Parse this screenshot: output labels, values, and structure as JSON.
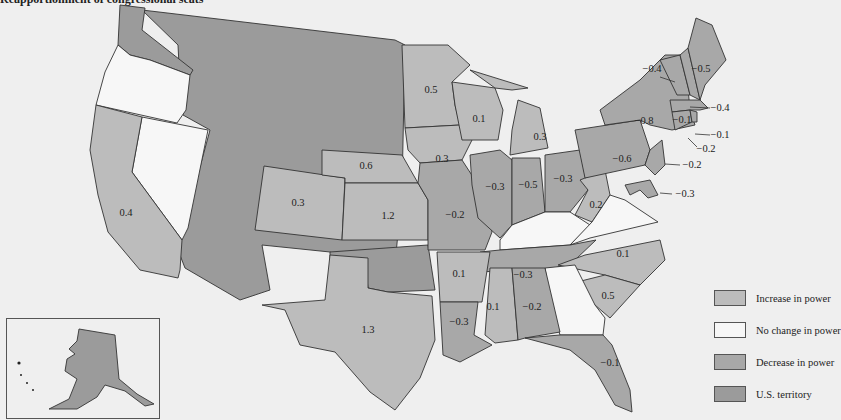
{
  "title": "Reapportionment of congressional seats",
  "colors": {
    "increase": "#bcbcbc",
    "no_change": "#f7f7f7",
    "decrease": "#a8a8a8",
    "territory": "#9b9b9b",
    "background": "#efefef"
  },
  "legend": {
    "items": [
      {
        "key": "increase",
        "label": "Increase in power"
      },
      {
        "key": "no_change",
        "label": "No change in power"
      },
      {
        "key": "decrease",
        "label": "Decrease in power"
      },
      {
        "key": "territory",
        "label": "U.S. territory"
      }
    ]
  },
  "states": {
    "WA": {
      "category": "territory",
      "value": ""
    },
    "OR": {
      "category": "no_change",
      "value": ""
    },
    "NV": {
      "category": "no_change",
      "value": ""
    },
    "CA": {
      "category": "increase",
      "value": "0.4"
    },
    "CO": {
      "category": "increase",
      "value": "0.3"
    },
    "NE": {
      "category": "increase",
      "value": "0.6"
    },
    "KS": {
      "category": "increase",
      "value": "1.2"
    },
    "MN": {
      "category": "increase",
      "value": "0.5"
    },
    "IA": {
      "category": "increase",
      "value": "0.3"
    },
    "WI": {
      "category": "increase",
      "value": "0.1"
    },
    "MI": {
      "category": "increase",
      "value": "0.3"
    },
    "MO": {
      "category": "decrease",
      "value": "-0.2"
    },
    "IL": {
      "category": "decrease",
      "value": "-0.3"
    },
    "IN": {
      "category": "decrease",
      "value": "-0.5"
    },
    "OH": {
      "category": "decrease",
      "value": "-0.3"
    },
    "WV": {
      "category": "increase",
      "value": "0.2"
    },
    "PA": {
      "category": "decrease",
      "value": "-0.6"
    },
    "NY": {
      "category": "decrease",
      "value": "-0.8"
    },
    "VT": {
      "category": "decrease",
      "value": "-0.4"
    },
    "ME": {
      "category": "decrease",
      "value": "-0.5"
    },
    "NH": {
      "category": "decrease",
      "value": "-0.4"
    },
    "MA": {
      "category": "decrease",
      "value": "-0.1"
    },
    "RI": {
      "category": "decrease",
      "value": "-0.1"
    },
    "CT": {
      "category": "decrease",
      "value": "-0.2"
    },
    "NJ": {
      "category": "decrease",
      "value": "-0.2"
    },
    "DE": {
      "category": "decrease",
      "value": "-0.3"
    },
    "KY": {
      "category": "no_change",
      "value": ""
    },
    "VA": {
      "category": "no_change",
      "value": ""
    },
    "TN": {
      "category": "decrease",
      "value": "-0.3"
    },
    "NC": {
      "category": "increase",
      "value": "0.1"
    },
    "SC": {
      "category": "increase",
      "value": "0.5"
    },
    "GA": {
      "category": "no_change",
      "value": ""
    },
    "AR": {
      "category": "increase",
      "value": "0.1"
    },
    "MS": {
      "category": "increase",
      "value": "0.1"
    },
    "AL": {
      "category": "decrease",
      "value": "-0.2"
    },
    "LA": {
      "category": "decrease",
      "value": "-0.3"
    },
    "FL": {
      "category": "decrease",
      "value": "-0.1"
    },
    "TX": {
      "category": "increase",
      "value": "1.3"
    },
    "OK": {
      "category": "territory",
      "value": ""
    },
    "territory_west": {
      "category": "territory",
      "value": ""
    },
    "AK": {
      "category": "territory",
      "value": ""
    }
  }
}
